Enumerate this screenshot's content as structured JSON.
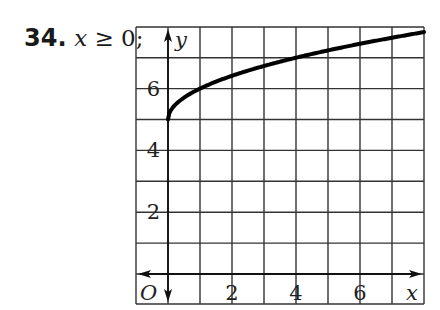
{
  "problem": {
    "number": "34.",
    "condition_var": "x",
    "condition_rest": " ≥ 0;"
  },
  "chart_data": {
    "type": "line",
    "title": "",
    "function": "y = sqrt(x) + 5",
    "domain": "x ≥ 0",
    "xlabel": "x",
    "ylabel": "y",
    "origin_label": "O",
    "xlim": [
      -1,
      8
    ],
    "ylim": [
      0,
      8
    ],
    "grid": true,
    "grid_step": 1,
    "x_ticks": [
      2,
      4,
      6
    ],
    "y_ticks": [
      2,
      4,
      6
    ],
    "x_tick_labels": [
      "2",
      "4",
      "6"
    ],
    "y_tick_labels": [
      "2",
      "4",
      "6"
    ],
    "series": [
      {
        "name": "y = √x + 5",
        "x": [
          0,
          0.25,
          0.5,
          1,
          2,
          3,
          4,
          5,
          6,
          7,
          8
        ],
        "y": [
          5,
          5.5,
          5.71,
          6,
          6.41,
          6.73,
          7,
          7.24,
          7.45,
          7.65,
          7.83
        ]
      }
    ]
  }
}
